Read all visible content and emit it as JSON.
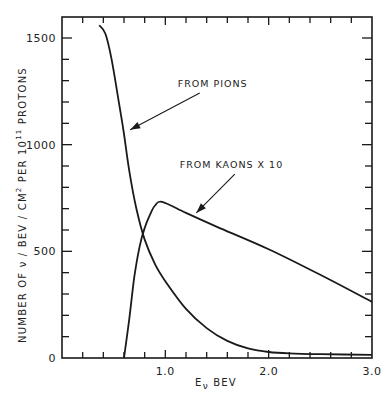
{
  "chart_data": {
    "type": "line",
    "title": "",
    "xlabel": "Eν BEV",
    "ylabel": "NUMBER OF ν / BEV / CM² PER 10¹¹ PROTONS",
    "xlim": [
      0,
      3.0
    ],
    "ylim": [
      0,
      1600
    ],
    "x_ticks": {
      "major": [
        1.0,
        2.0,
        3.0
      ],
      "minor_step": 0.2
    },
    "y_ticks": {
      "major": [
        0,
        500,
        1000,
        1500
      ],
      "minor_step": 100
    },
    "x_tick_labels": [
      "1.0",
      "2.0",
      "3.0"
    ],
    "y_tick_labels": [
      "0",
      "500",
      "1000",
      "1500"
    ],
    "grid": false,
    "legend": null,
    "series": [
      {
        "name": "FROM PIONS",
        "x": [
          0.36,
          0.42,
          0.48,
          0.55,
          0.6,
          0.65,
          0.72,
          0.8,
          0.9,
          1.0,
          1.2,
          1.4,
          1.6,
          1.8,
          2.0,
          2.2,
          2.5,
          3.0
        ],
        "y": [
          1560,
          1520,
          1400,
          1200,
          1050,
          880,
          700,
          555,
          440,
          360,
          230,
          140,
          80,
          45,
          28,
          22,
          18,
          15
        ]
      },
      {
        "name": "FROM KAONS X 10",
        "x": [
          0.6,
          0.65,
          0.7,
          0.75,
          0.8,
          0.85,
          0.9,
          0.97,
          1.2,
          1.5,
          2.0,
          2.5,
          3.0
        ],
        "y": [
          0,
          180,
          380,
          520,
          610,
          670,
          715,
          732,
          680,
          615,
          510,
          390,
          263
        ]
      }
    ],
    "annotations": [
      {
        "text": "FROM PIONS",
        "label_at": [
          1.12,
          1270
        ],
        "arrow_to": [
          0.66,
          1070
        ]
      },
      {
        "text": "FROM KAONS X 10",
        "label_at": [
          1.14,
          890
        ],
        "arrow_to": [
          1.3,
          680
        ]
      }
    ]
  }
}
